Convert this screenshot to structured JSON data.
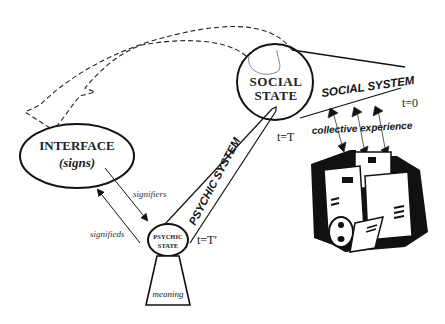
{
  "diagram": {
    "nodes": {
      "interface": {
        "title": "INTERFACE",
        "subtitle": "(signs)"
      },
      "social_state": {
        "line1": "SOCIAL",
        "line2": "STATE"
      },
      "psychic_state": {
        "line1": "PSYCHIC",
        "line2": "STATE"
      },
      "meaning": {
        "label": "meaning"
      }
    },
    "systems": {
      "social": "SOCIAL SYSTEM",
      "psychic": "PSYCHIC SYSTEM"
    },
    "arrows": {
      "signifiers": "signifiers",
      "signifieds": "signifieds",
      "collective": "collective experience"
    },
    "time_labels": {
      "t0": "t=0",
      "tT": "t=T",
      "tTprime": "t=T′"
    },
    "icons": {
      "buildings": "buildings-clipart-icon"
    }
  }
}
